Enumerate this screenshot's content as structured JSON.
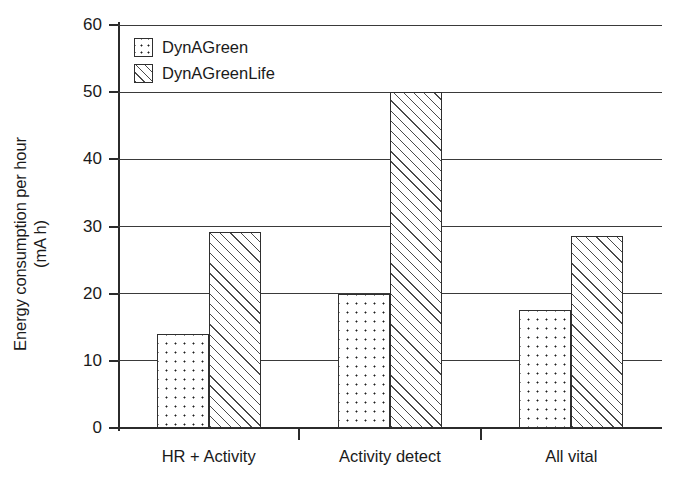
{
  "chart_data": {
    "type": "bar",
    "title": "",
    "subtitle": "",
    "xlabel": "",
    "ylabel": "Energy consumption per hour",
    "ylabel_units": "(mA h)",
    "ylabel_lines": [
      "Energy consumption per hour",
      "(mA h)"
    ],
    "categories": [
      "HR + Activity",
      "Activity detect",
      "All vital"
    ],
    "series": [
      {
        "name": "DynAGreen",
        "pattern": "dotted",
        "values": [
          14.0,
          20.0,
          17.6
        ]
      },
      {
        "name": "DynAGreenLife",
        "pattern": "hatched",
        "values": [
          29.2,
          50.0,
          28.6
        ]
      }
    ],
    "ylim": [
      0,
      60
    ],
    "yticks": [
      0,
      10,
      20,
      30,
      40,
      50,
      60
    ],
    "ytick_labels": [
      "0",
      "10",
      "20",
      "30",
      "40",
      "50",
      "60"
    ],
    "grid": "horizontal",
    "legend_position": "top-left-inside",
    "colors": {
      "axis": "#2b2b2b",
      "grid": "#3a3a3a",
      "bar_outline": "#2f2f2f",
      "pattern": "#1c1c1c",
      "background": "#ffffff",
      "text": "#1a1a1a"
    }
  },
  "legend": {
    "items": [
      {
        "label": "DynAGreen",
        "pattern": "dotted"
      },
      {
        "label": "DynAGreenLife",
        "pattern": "hatched"
      }
    ]
  }
}
